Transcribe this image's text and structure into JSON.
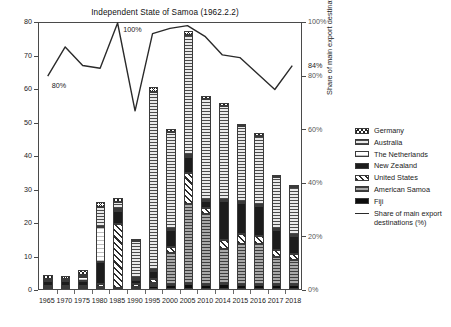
{
  "chart_data": {
    "type": "bar",
    "title": "Independent State of Samoa (1962.2.2)",
    "xlabel": "",
    "ylabel": "Million of US$",
    "y2label": "Share of main export destinations (%)",
    "ylim": [
      0,
      80
    ],
    "y2lim": [
      0,
      100
    ],
    "grid": false,
    "legend_position": "right",
    "categories": [
      "1965",
      "1970",
      "1975",
      "1980",
      "1985",
      "1990",
      "1995",
      "2000",
      "2005",
      "2010",
      "2014",
      "2015",
      "2016",
      "2017",
      "2018"
    ],
    "yticks": [
      "0",
      "10",
      "20",
      "30",
      "40",
      "50",
      "60",
      "70",
      "80"
    ],
    "y2ticks": [
      "0%",
      "20%",
      "40%",
      "60%",
      "80%",
      "100%"
    ],
    "series": [
      {
        "name": "Fiji",
        "pattern": "p-fiji",
        "values": [
          0.3,
          0.3,
          0.3,
          0.5,
          0.4,
          0.6,
          0.8,
          1.2,
          1.5,
          1.3,
          1.4,
          1.3,
          1.3,
          1.1,
          1.1
        ]
      },
      {
        "name": "American Samoa",
        "pattern": "p-americansamoa",
        "values": [
          0.0,
          0.0,
          0.0,
          0.0,
          0.0,
          0.0,
          0.9,
          9.5,
          24.0,
          21.0,
          10.5,
          12.0,
          12.0,
          8.5,
          7.5
        ]
      },
      {
        "name": "United States",
        "pattern": "p-unitedstates",
        "values": [
          0.6,
          0.5,
          0.5,
          1.0,
          19.0,
          1.0,
          1.3,
          1.8,
          9.0,
          2.0,
          2.8,
          3.0,
          2.6,
          2.0,
          1.8
        ]
      },
      {
        "name": "New Zealand",
        "pattern": "p-newzealand",
        "values": [
          1.5,
          1.5,
          1.6,
          6.5,
          4.0,
          1.2,
          2.5,
          5.0,
          5.0,
          2.0,
          11.5,
          9.5,
          9.0,
          6.0,
          5.5
        ]
      },
      {
        "name": "The Netherlands",
        "pattern": "p-netherlands",
        "values": [
          0.2,
          0.2,
          1.2,
          10.5,
          0.6,
          0.4,
          0.3,
          0.3,
          0.4,
          0.3,
          0.3,
          0.3,
          0.3,
          0.2,
          0.2
        ]
      },
      {
        "name": "Australia",
        "pattern": "p-australia",
        "values": [
          0.5,
          0.4,
          0.5,
          6.0,
          2.0,
          11.0,
          53.0,
          29.0,
          36.0,
          30.0,
          28.0,
          22.5,
          20.5,
          15.5,
          14.5
        ]
      },
      {
        "name": "Germany",
        "pattern": "p-germany",
        "values": [
          1.0,
          1.0,
          1.6,
          1.5,
          1.3,
          0.8,
          1.5,
          1.0,
          1.0,
          0.9,
          0.9,
          0.8,
          0.8,
          0.7,
          0.6
        ]
      }
    ],
    "totals": [
      4.1,
      3.9,
      5.7,
      26.0,
      27.3,
      15.0,
      60.3,
      47.8,
      76.9,
      57.5,
      55.4,
      49.4,
      46.5,
      34.0,
      31.2
    ],
    "line": {
      "name": "Share of main export destinations (%)",
      "values": [
        80,
        91,
        84,
        83,
        100,
        67,
        96,
        98,
        99,
        95,
        88,
        87,
        81,
        75,
        84
      ],
      "unit": "%"
    },
    "annotations": [
      {
        "text": "80%",
        "value": 80,
        "at_category": "1965"
      },
      {
        "text": "100%",
        "value": 100,
        "at_category": "1985"
      },
      {
        "text": "84%",
        "value": 84,
        "at_category": "2018"
      }
    ]
  },
  "legend": {
    "items": [
      {
        "label": "Germany",
        "kind": "swatch",
        "pattern": "p-germany"
      },
      {
        "label": "Australia",
        "kind": "swatch",
        "pattern": "p-australia"
      },
      {
        "label": "The Netherlands",
        "kind": "swatch",
        "pattern": "p-netherlands"
      },
      {
        "label": "New Zealand",
        "kind": "swatch",
        "pattern": "p-newzealand"
      },
      {
        "label": "United States",
        "kind": "swatch",
        "pattern": "p-unitedstates"
      },
      {
        "label": "American Samoa",
        "kind": "swatch",
        "pattern": "p-americansamoa"
      },
      {
        "label": "Fiji",
        "kind": "swatch",
        "pattern": "p-fiji"
      },
      {
        "label": "Share of main export destinations (%)",
        "kind": "line",
        "pattern": ""
      }
    ]
  },
  "colors": {
    "axis": "#4a4a4a",
    "line": "#2a2a2a",
    "text": "#1a1a1a",
    "tick_secondary": "#555555",
    "background": "#ffffff"
  }
}
